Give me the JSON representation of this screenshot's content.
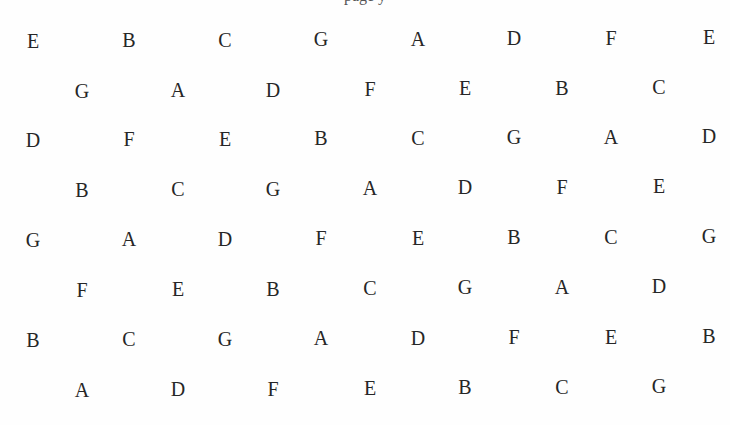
{
  "document": {
    "header_partial_text": "page y",
    "background": "#ffffff",
    "text_color": "#262626"
  },
  "grid": {
    "long_row_x": [
      33,
      129,
      225,
      321,
      418,
      514,
      611,
      709
    ],
    "short_row_x": [
      82,
      178,
      273,
      370,
      465,
      562,
      659
    ],
    "rows": [
      {
        "y": 29,
        "type": "long",
        "letters": [
          "E",
          "B",
          "C",
          "G",
          "A",
          "D",
          "F",
          "E"
        ]
      },
      {
        "y": 79,
        "type": "short",
        "letters": [
          "G",
          "A",
          "D",
          "F",
          "E",
          "B",
          "C"
        ]
      },
      {
        "y": 128,
        "type": "long",
        "letters": [
          "D",
          "F",
          "E",
          "B",
          "C",
          "G",
          "A",
          "D"
        ]
      },
      {
        "y": 178,
        "type": "short",
        "letters": [
          "B",
          "C",
          "G",
          "A",
          "D",
          "F",
          "E"
        ]
      },
      {
        "y": 228,
        "type": "long",
        "letters": [
          "G",
          "A",
          "D",
          "F",
          "E",
          "B",
          "C",
          "G"
        ]
      },
      {
        "y": 278,
        "type": "short",
        "letters": [
          "F",
          "E",
          "B",
          "C",
          "G",
          "A",
          "D"
        ]
      },
      {
        "y": 328,
        "type": "long",
        "letters": [
          "B",
          "C",
          "G",
          "A",
          "D",
          "F",
          "E",
          "B"
        ]
      },
      {
        "y": 378,
        "type": "short",
        "letters": [
          "A",
          "D",
          "F",
          "E",
          "B",
          "C",
          "G"
        ]
      }
    ]
  }
}
